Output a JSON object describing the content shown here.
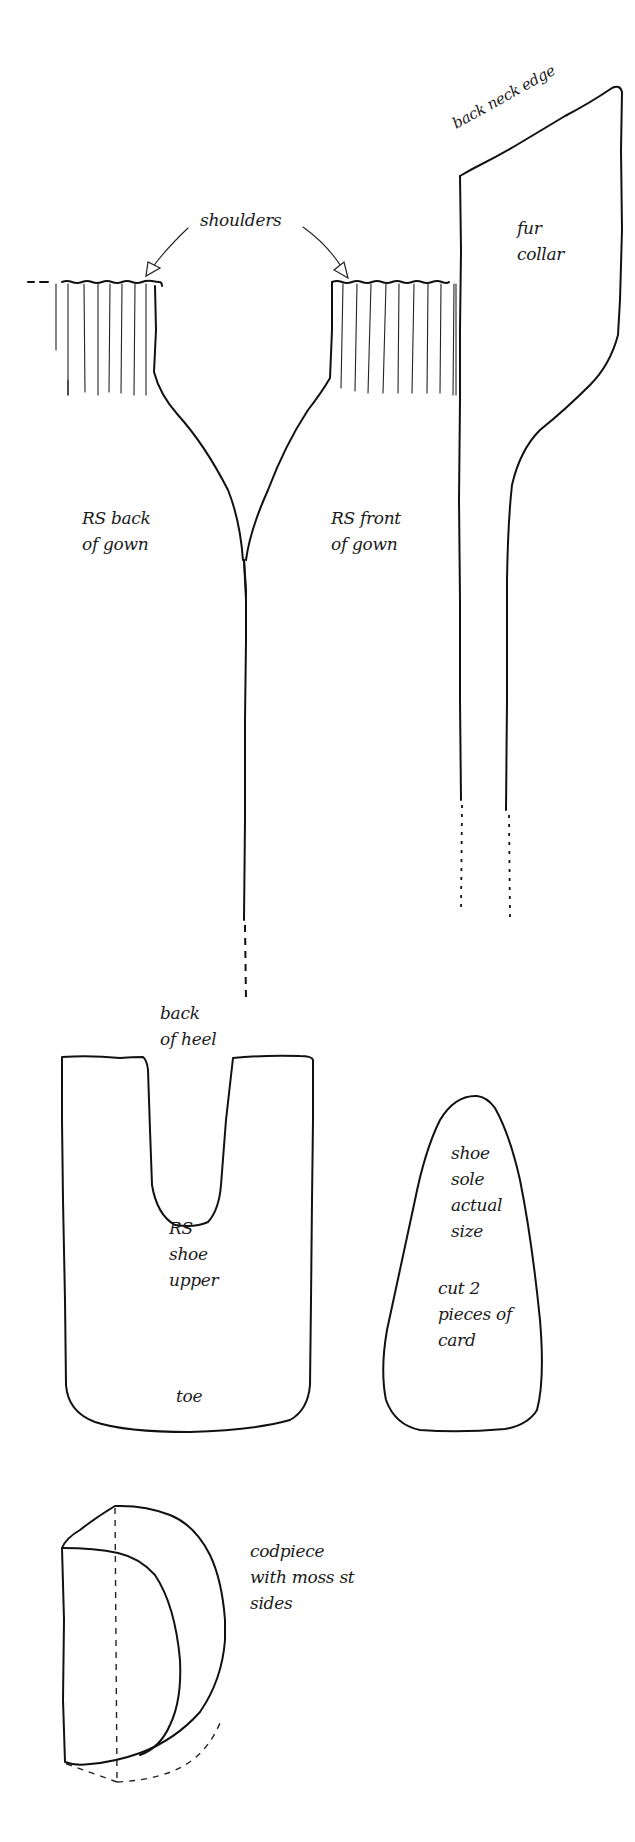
{
  "diagram": {
    "type": "knitting pattern pieces",
    "pieces": [
      {
        "id": "gown-back",
        "label_lines": [
          "RS back",
          "of gown"
        ]
      },
      {
        "id": "gown-front",
        "label_lines": [
          "RS front",
          "of gown"
        ]
      },
      {
        "id": "fur-collar",
        "label_lines": [
          "fur",
          "collar"
        ],
        "edge_label": "back neck edge"
      },
      {
        "id": "shoe-upper",
        "label_lines": [
          "RS",
          "shoe",
          "upper"
        ],
        "top_label_lines": [
          "back",
          "of heel"
        ],
        "bottom_label": "toe"
      },
      {
        "id": "shoe-sole",
        "label_lines": [
          "shoe",
          "sole",
          "actual",
          "size"
        ],
        "note_lines": [
          "cut 2",
          "pieces of",
          "card"
        ]
      },
      {
        "id": "codpiece",
        "label_lines": [
          "codpiece",
          "with moss st",
          "sides"
        ]
      }
    ],
    "annotations": {
      "shoulders": "shoulders"
    },
    "colors": {
      "line": "#111111",
      "background": "#ffffff"
    }
  },
  "labels": {
    "back_neck_edge": "back neck edge",
    "fur_collar": "fur\ncollar",
    "shoulders": "shoulders",
    "gown_back": "RS back\nof gown",
    "gown_front": "RS front\nof gown",
    "back_of_heel": "back\nof heel",
    "shoe_upper": "RS\nshoe\nupper",
    "toe": "toe",
    "shoe_sole": "shoe\nsole\nactual\nsize",
    "cut_note": "cut 2\npieces of\ncard",
    "codpiece": "codpiece\nwith moss st\nsides"
  }
}
